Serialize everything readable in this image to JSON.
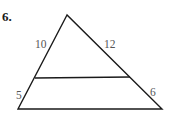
{
  "problem": {
    "number": "6."
  },
  "triangle": {
    "labels": {
      "left_upper": "10",
      "right_upper": "12",
      "left_lower": "5",
      "right_lower": "6"
    },
    "vertices": {
      "apex": [
        67,
        15
      ],
      "bottom_left": [
        18,
        109
      ],
      "bottom_right": [
        162,
        109
      ]
    },
    "parallel_segment": {
      "left": [
        35,
        78
      ],
      "right": [
        130,
        77
      ]
    },
    "stroke_color": "#1a1a1a"
  }
}
